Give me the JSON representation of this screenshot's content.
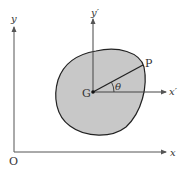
{
  "diagram": {
    "labels": {
      "origin": "O",
      "x_axis": "x",
      "y_axis": "y",
      "centroid": "G",
      "x_prime_axis": "x′",
      "y_prime_axis": "y′",
      "point": "P",
      "angle": "θ"
    },
    "colors": {
      "region_fill": "#c8c8c8",
      "stroke": "#222222",
      "axis": "#555555"
    }
  }
}
